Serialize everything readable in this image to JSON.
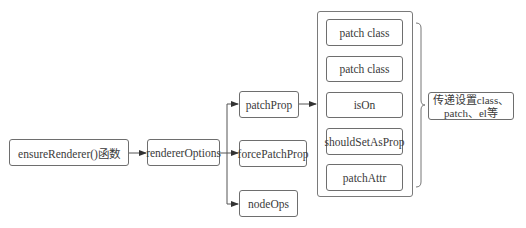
{
  "diagram": {
    "nodes": {
      "ensure_renderer": "ensureRenderer()函数",
      "renderer_options": "rendererOptions",
      "patch_prop": "patchProp",
      "force_patch_prop": "forcePatchProp",
      "node_ops": "nodeOps"
    },
    "patch_prop_children": [
      "patch class",
      "patch class",
      "isOn",
      "shouldSetAsProp",
      "patchAttr"
    ],
    "note": {
      "line1": "传递设置class、",
      "line2": "patch、el等"
    },
    "edges": [
      [
        "ensure_renderer",
        "renderer_options"
      ],
      [
        "renderer_options",
        "patch_prop"
      ],
      [
        "renderer_options",
        "force_patch_prop"
      ],
      [
        "renderer_options",
        "node_ops"
      ],
      [
        "patch_prop",
        "patch_prop_children"
      ]
    ],
    "colors": {
      "stroke": "#6e6e6e",
      "text": "#3a3a3a",
      "background": "#ffffff"
    }
  }
}
